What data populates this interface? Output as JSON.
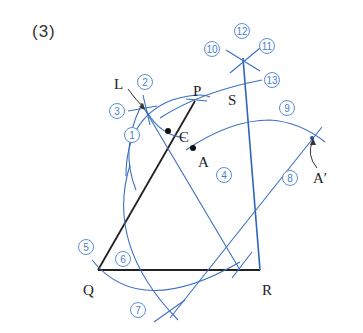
{
  "figure": {
    "heading": "(3)",
    "colors": {
      "construction": "#3a6fc4",
      "segment": "#222222",
      "step_marker": "#4a7fcf"
    },
    "points": [
      {
        "name": "L",
        "label": "L"
      },
      {
        "name": "P",
        "label": "P"
      },
      {
        "name": "C",
        "label": "C"
      },
      {
        "name": "A",
        "label": "A"
      },
      {
        "name": "S",
        "label": "S"
      },
      {
        "name": "Q",
        "label": "Q"
      },
      {
        "name": "R",
        "label": "R"
      },
      {
        "name": "A-prime",
        "label": "A′"
      }
    ],
    "steps": [
      {
        "n": "1",
        "label": "①"
      },
      {
        "n": "2",
        "label": "②"
      },
      {
        "n": "3",
        "label": "③"
      },
      {
        "n": "4",
        "label": "④"
      },
      {
        "n": "5",
        "label": "⑤"
      },
      {
        "n": "6",
        "label": "⑥"
      },
      {
        "n": "7",
        "label": "⑦"
      },
      {
        "n": "8",
        "label": "⑧"
      },
      {
        "n": "9",
        "label": "⑨"
      },
      {
        "n": "10",
        "label": "⑩"
      },
      {
        "n": "11",
        "label": "⑪"
      },
      {
        "n": "12",
        "label": "⑫"
      },
      {
        "n": "13",
        "label": "⑬"
      }
    ]
  }
}
